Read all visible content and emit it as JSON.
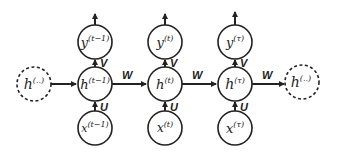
{
  "diagram": {
    "type": "unfolded-rnn",
    "colors": {
      "stroke": "#222222",
      "background": "#ffffff"
    },
    "edge_labels": {
      "input": "U",
      "output": "V",
      "recurrent": "W"
    },
    "boundary_nodes": {
      "left": {
        "base": "h",
        "sup": "(..)",
        "style": "dashed"
      },
      "right": {
        "base": "h",
        "sup": "(..)",
        "style": "dashed"
      }
    },
    "columns": [
      {
        "output": {
          "base": "y",
          "sup": "(t−1)"
        },
        "hidden": {
          "base": "h",
          "sup": "(t−1)"
        },
        "input": {
          "base": "x",
          "sup": "(t−1)"
        }
      },
      {
        "output": {
          "base": "y",
          "sup": "(t)"
        },
        "hidden": {
          "base": "h",
          "sup": "(t)"
        },
        "input": {
          "base": "x",
          "sup": "(t)"
        }
      },
      {
        "output": {
          "base": "y",
          "sup": "(τ)"
        },
        "hidden": {
          "base": "h",
          "sup": "(τ)"
        },
        "input": {
          "base": "x",
          "sup": "(τ)"
        }
      }
    ]
  }
}
